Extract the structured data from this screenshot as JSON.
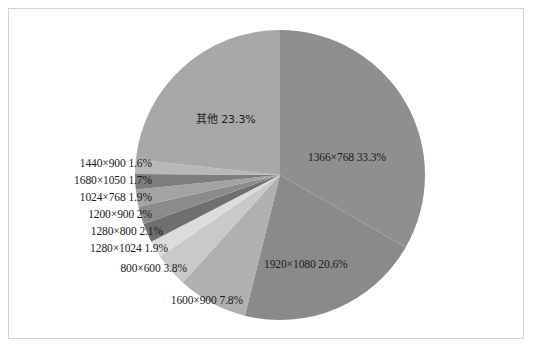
{
  "chart_data": {
    "type": "pie",
    "title": "",
    "subtitle": "",
    "xlabel": "",
    "ylabel": "",
    "legend_position": "none",
    "grid": false,
    "start_angle_deg": 0,
    "direction": "clockwise",
    "center": {
      "x": 280,
      "y": 175
    },
    "radius": 145,
    "categories": [
      "1366×768",
      "1920×1080",
      "1600×900",
      "800×600",
      "1280×1024",
      "1280×800",
      "1200×900",
      "1024×768",
      "1680×1050",
      "1440×900",
      "其他"
    ],
    "values": [
      33.3,
      20.6,
      7.8,
      3.8,
      1.9,
      2.1,
      2.0,
      1.9,
      1.7,
      1.6,
      23.3
    ],
    "value_labels": [
      "33.3%",
      "20.6%",
      "7.8%",
      "3.8%",
      "1.9%",
      "2.1%",
      "2%",
      "1.9%",
      "1.7%",
      "1.6%",
      "23.3%"
    ],
    "colors": [
      "#8f8f8f",
      "#8a8a8a",
      "#b0b0b0",
      "#c9c9c9",
      "#dcdcdc",
      "#6f6f6f",
      "#8b8b8b",
      "#a3a3a3",
      "#7d7d7d",
      "#b8b8b8",
      "#a8a8a8"
    ],
    "annotations": [
      {
        "text": "其他 23.3%",
        "placement": "inside"
      },
      {
        "text": "1366×768 33.3%",
        "placement": "inside"
      },
      {
        "text": "1920×1080 20.6%",
        "placement": "inside"
      },
      {
        "text": "1440×900  1.6%",
        "placement": "outside-left"
      },
      {
        "text": "1680×1050 1.7%",
        "placement": "outside-left"
      },
      {
        "text": "1024×768  1.9%",
        "placement": "outside-left"
      },
      {
        "text": "1200×900 2%",
        "placement": "outside-left"
      },
      {
        "text": "1280×800 2.1%",
        "placement": "outside-left"
      },
      {
        "text": "1280×1024 1.9%",
        "placement": "outside-left"
      },
      {
        "text": "800×600  3.8%",
        "placement": "outside-left"
      },
      {
        "text": "1600×900 7.8%",
        "placement": "outside-bottom"
      }
    ]
  },
  "labels": {
    "other": "其他 23.3%",
    "res_1366": "1366×768 33.3%",
    "res_1920": "1920×1080 20.6%",
    "res_1440": "1440×900  1.6%",
    "res_1680": "1680×1050 1.7%",
    "res_1024": "1024×768  1.9%",
    "res_1200": "1200×900 2%",
    "res_1280x800": "1280×800 2.1%",
    "res_1280x1024": "1280×1024 1.9%",
    "res_800": "800×600  3.8%",
    "res_1600": "1600×900 7.8%"
  },
  "frame": {
    "border_color": "#d3d3d3",
    "background_color": "#ffffff"
  }
}
